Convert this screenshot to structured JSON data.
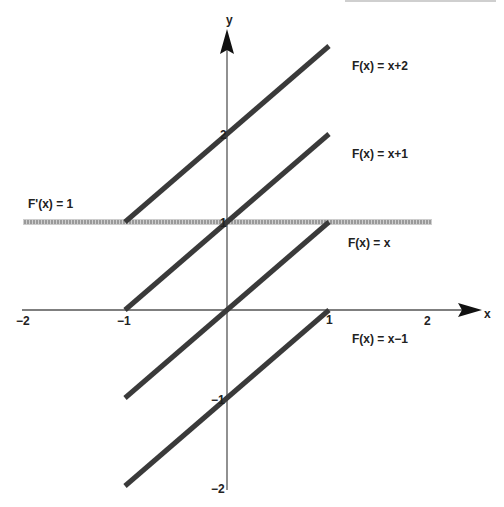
{
  "chart_data": {
    "type": "line",
    "title": "",
    "xlabel": "x",
    "ylabel": "y",
    "xlim": [
      -2,
      2.5
    ],
    "ylim": [
      -2,
      3.1
    ],
    "grid": false,
    "x_ticks": [
      "−2",
      "−1",
      "1",
      "2"
    ],
    "y_ticks": [
      "−2",
      "−1",
      "1",
      "2"
    ],
    "series": [
      {
        "name": "F(x) = x+2",
        "label": "F(x) = x+2",
        "x": [
          -1,
          1
        ],
        "y": [
          1,
          3
        ],
        "color": "#3a3a3a"
      },
      {
        "name": "F(x) = x+1",
        "label": "F(x) = x+1",
        "x": [
          -1,
          1
        ],
        "y": [
          0,
          2
        ],
        "color": "#3a3a3a"
      },
      {
        "name": "F(x) = x",
        "label": "F(x) = x",
        "x": [
          -1,
          1
        ],
        "y": [
          -1,
          1
        ],
        "color": "#3a3a3a"
      },
      {
        "name": "F(x) = x−1",
        "label": "F(x) = x−1",
        "x": [
          -1,
          1
        ],
        "y": [
          -2,
          0
        ],
        "color": "#3a3a3a"
      },
      {
        "name": "F'(x) = 1",
        "label": "F'(x) = 1",
        "x": [
          -2,
          2
        ],
        "y": [
          1,
          1
        ],
        "color": "#9a9a9a",
        "style": "hatched"
      }
    ]
  }
}
